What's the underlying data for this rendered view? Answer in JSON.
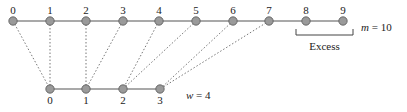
{
  "diagram": {
    "top_row": {
      "label_name": "m",
      "size_label": "m = 10",
      "count": 10,
      "y": 21,
      "x_positions": [
        13,
        50,
        86,
        123,
        159,
        196,
        233,
        269,
        306,
        343
      ],
      "node_labels": [
        "0",
        "1",
        "2",
        "3",
        "4",
        "5",
        "6",
        "7",
        "8",
        "9"
      ]
    },
    "bottom_row": {
      "label_name": "w",
      "size_label": "w = 4",
      "count": 4,
      "y": 89,
      "x_positions": [
        50,
        86,
        123,
        160
      ],
      "node_labels": [
        "0",
        "1",
        "2",
        "3"
      ]
    },
    "mapping": [
      {
        "from": 0,
        "to": 0
      },
      {
        "from": 1,
        "to": 0
      },
      {
        "from": 2,
        "to": 1
      },
      {
        "from": 3,
        "to": 1
      },
      {
        "from": 4,
        "to": 2
      },
      {
        "from": 5,
        "to": 2
      },
      {
        "from": 6,
        "to": 3
      },
      {
        "from": 7,
        "to": 3
      }
    ],
    "excess": {
      "label": "Excess",
      "covers": [
        8,
        9
      ]
    },
    "colors": {
      "node_fill": "#9a9a9a",
      "node_stroke": "#555555",
      "edge": "#555555",
      "dotted": "#777777",
      "text": "#222222"
    }
  }
}
